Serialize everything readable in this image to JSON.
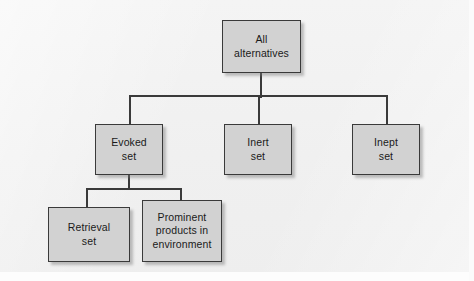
{
  "diagram": {
    "type": "tree",
    "background_color": "#f2f2f2",
    "node_fill_color": "#d2d2d2",
    "node_border_color": "#3a3a3a",
    "connector_color": "#3a3a3a",
    "text_color": "#1a1a1a",
    "nodes": [
      {
        "id": "all-alternatives",
        "label": "All\nalternatives",
        "level": 0
      },
      {
        "id": "evoked-set",
        "label": "Evoked\nset",
        "level": 1
      },
      {
        "id": "inert-set",
        "label": "Inert\nset",
        "level": 1
      },
      {
        "id": "inept-set",
        "label": "Inept\nset",
        "level": 1
      },
      {
        "id": "retrieval-set",
        "label": "Retrieval\nset",
        "level": 2
      },
      {
        "id": "prominent-products",
        "label": "Prominent\nproducts in\nenvironment",
        "level": 2
      }
    ],
    "edges": [
      {
        "from": "all-alternatives",
        "to": "evoked-set"
      },
      {
        "from": "all-alternatives",
        "to": "inert-set"
      },
      {
        "from": "all-alternatives",
        "to": "inept-set"
      },
      {
        "from": "evoked-set",
        "to": "retrieval-set"
      },
      {
        "from": "evoked-set",
        "to": "prominent-products"
      }
    ]
  }
}
